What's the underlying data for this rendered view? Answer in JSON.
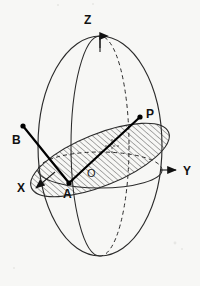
{
  "figure": {
    "kind": "geometry-diagram",
    "background_color": "#f7f7f5",
    "ink_color": "#2b2b2b"
  },
  "axes": [
    {
      "id": "z",
      "label": "Z",
      "direction": "up",
      "label_x": 84,
      "label_y": 24
    },
    {
      "id": "y",
      "label": "Y",
      "direction": "right",
      "label_x": 183,
      "label_y": 170
    },
    {
      "id": "x",
      "label": "X",
      "direction": "down-left",
      "label_x": 23,
      "label_y": 190
    }
  ],
  "points": [
    {
      "id": "p",
      "label": "P",
      "label_x": 151,
      "label_y": 119,
      "dot_x": 140,
      "dot_y": 117,
      "dot_r": 2.6
    },
    {
      "id": "b",
      "label": "B",
      "label_x": 16,
      "label_y": 140,
      "dot_x": 23,
      "dot_y": 126,
      "dot_r": 2.6
    },
    {
      "id": "a",
      "label": "A",
      "label_x": 64,
      "label_y": 197,
      "dot_x": 69,
      "dot_y": 183,
      "dot_r": 2.6
    },
    {
      "id": "o",
      "label": "O",
      "label_x": 89,
      "label_y": 176,
      "dot_x": null,
      "dot_y": null,
      "dot_r": 0
    }
  ],
  "segments": [
    {
      "id": "a-to-b",
      "from": "A",
      "to": "B",
      "x1": 69,
      "y1": 183,
      "x2": 23,
      "y2": 126
    },
    {
      "id": "a-to-p",
      "from": "A",
      "to": "P",
      "x1": 69,
      "y1": 183,
      "x2": 140,
      "y2": 117
    }
  ],
  "shapes": {
    "sphere": {
      "cx": 100,
      "cy": 146,
      "rx": 62,
      "ry": 110
    },
    "meridian": {
      "cx": 100,
      "cy": 146,
      "rx": 29,
      "ry": 110
    },
    "equator": {
      "cx": 100,
      "cy": 170,
      "rx": 62,
      "ry": 18
    },
    "tilted_plane": {
      "cx": 100,
      "cy": 160,
      "rx": 74,
      "ry": 26,
      "rotation_deg": -22,
      "hatched": true
    }
  },
  "marks": {
    "right_angle": {
      "x": 112,
      "y": 146,
      "size": 7
    }
  }
}
